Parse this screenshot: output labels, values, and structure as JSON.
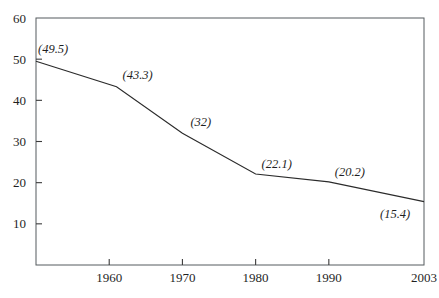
{
  "chart_data": {
    "type": "line",
    "title": "",
    "subtitle": "",
    "xlabel": "",
    "ylabel": "",
    "xlim": [
      1950,
      2003
    ],
    "ylim": [
      0,
      60
    ],
    "grid": false,
    "legend": null,
    "legend_position": "none",
    "x": [
      1950,
      1961,
      1970,
      1980,
      1990,
      2003
    ],
    "values": [
      49.5,
      43.3,
      32,
      22.1,
      20.2,
      15.4
    ],
    "point_labels": [
      "(49.5)",
      "(43.3)",
      "(32)",
      "(22.1)",
      "(20.2)",
      "(15.4)"
    ],
    "series": [
      {
        "name": "",
        "x": [
          1950,
          1961,
          1970,
          1980,
          1990,
          2003
        ],
        "values": [
          49.5,
          43.3,
          32,
          22.1,
          20.2,
          15.4
        ]
      }
    ],
    "y_ticks": [
      10,
      20,
      30,
      40,
      50,
      60
    ],
    "y_tick_labels": [
      "10",
      "20",
      "30",
      "40",
      "50",
      "60"
    ],
    "x_ticks": [
      1960,
      1970,
      1980,
      1990,
      2003
    ],
    "x_tick_labels": [
      "1960",
      "1970",
      "1980",
      "1990",
      "2003"
    ],
    "colors": {
      "line": "#2b2b2b",
      "frame": "#555b5e",
      "text": "#1f1f1f",
      "background": "#ffffff"
    },
    "annotations": [
      {
        "label": "(49.5)",
        "x": 1950,
        "y": 49.5
      },
      {
        "label": "(43.3)",
        "x": 1961,
        "y": 43.3
      },
      {
        "label": "(32)",
        "x": 1970,
        "y": 32
      },
      {
        "label": "(22.1)",
        "x": 1980,
        "y": 22.1
      },
      {
        "label": "(20.2)",
        "x": 1990,
        "y": 20.2
      },
      {
        "label": "(15.4)",
        "x": 2003,
        "y": 15.4
      }
    ]
  }
}
